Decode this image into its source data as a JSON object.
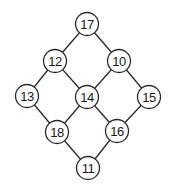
{
  "diagram": {
    "type": "graph",
    "node_radius": 11.5,
    "nodes": [
      {
        "id": "n17",
        "label": "17",
        "x": 87,
        "y": 24
      },
      {
        "id": "n12",
        "label": "12",
        "x": 55,
        "y": 61
      },
      {
        "id": "n10",
        "label": "10",
        "x": 119,
        "y": 61
      },
      {
        "id": "n13",
        "label": "13",
        "x": 27,
        "y": 96
      },
      {
        "id": "n14",
        "label": "14",
        "x": 87,
        "y": 97
      },
      {
        "id": "n15",
        "label": "15",
        "x": 149,
        "y": 97
      },
      {
        "id": "n18",
        "label": "18",
        "x": 57,
        "y": 132
      },
      {
        "id": "n16",
        "label": "16",
        "x": 117,
        "y": 131
      },
      {
        "id": "n11",
        "label": "11",
        "x": 88,
        "y": 168
      }
    ],
    "edges": [
      [
        "n17",
        "n12"
      ],
      [
        "n17",
        "n10"
      ],
      [
        "n12",
        "n13"
      ],
      [
        "n12",
        "n14"
      ],
      [
        "n10",
        "n14"
      ],
      [
        "n10",
        "n15"
      ],
      [
        "n13",
        "n18"
      ],
      [
        "n14",
        "n18"
      ],
      [
        "n14",
        "n16"
      ],
      [
        "n15",
        "n16"
      ],
      [
        "n18",
        "n11"
      ],
      [
        "n16",
        "n11"
      ]
    ]
  }
}
